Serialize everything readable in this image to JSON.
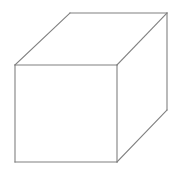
{
  "figure": {
    "kind": "3d-wireframe-solid",
    "shape_name": "cube",
    "projection": "oblique-parallel",
    "canvas": {
      "width": 178,
      "height": 174,
      "background_color": "#ffffff"
    },
    "style": {
      "stroke_color": "#808080",
      "stroke_width": 1.1,
      "fill_color": "#ffffff",
      "hidden_lines_visible": false,
      "labels_visible": false,
      "shading": "none"
    },
    "vertices": {
      "front_top_left": {
        "x": 15,
        "y": 65
      },
      "front_top_right": {
        "x": 117,
        "y": 65
      },
      "front_bottom_right": {
        "x": 117,
        "y": 162
      },
      "front_bottom_left": {
        "x": 15,
        "y": 162
      },
      "back_top_left": {
        "x": 70,
        "y": 13
      },
      "back_top_right": {
        "x": 167,
        "y": 13
      },
      "back_bottom_right": {
        "x": 167,
        "y": 110
      },
      "back_bottom_left": {
        "x": 70,
        "y": 110
      }
    },
    "faces": [
      {
        "name": "front-face",
        "visible": true,
        "points": "15,65 117,65 117,162 15,162"
      },
      {
        "name": "top-face",
        "visible": true,
        "points": "15,65 70,13 167,13 117,65"
      },
      {
        "name": "right-face",
        "visible": true,
        "points": "117,65 167,13 167,110 117,162"
      }
    ],
    "edges": [
      {
        "name": "edge-front-top",
        "points": "15,65 117,65"
      },
      {
        "name": "edge-front-right",
        "points": "117,65 117,162"
      },
      {
        "name": "edge-front-bottom",
        "points": "15,162 117,162"
      },
      {
        "name": "edge-front-left",
        "points": "15,65 15,162"
      },
      {
        "name": "edge-top-back",
        "points": "70,13 167,13"
      },
      {
        "name": "edge-top-left-receding",
        "points": "15,65 70,13"
      },
      {
        "name": "edge-top-right-receding",
        "points": "117,65 167,13"
      },
      {
        "name": "edge-back-right-vertical",
        "points": "167,13 167,110"
      },
      {
        "name": "edge-bottom-right-receding",
        "points": "117,162 167,110"
      }
    ]
  }
}
